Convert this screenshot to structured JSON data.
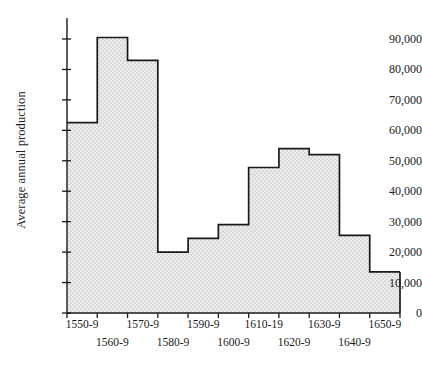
{
  "chart_data": {
    "type": "bar",
    "title": "",
    "subtitle": "",
    "xlabel": "",
    "ylabel": "Average annual production",
    "categories": [
      "1550-9",
      "1560-9",
      "1570-9",
      "1580-9",
      "1590-9",
      "1600-9",
      "1610-19",
      "1620-9",
      "1630-9",
      "1640-9",
      "1650-9"
    ],
    "values": [
      62500,
      90500,
      83000,
      20000,
      24500,
      29000,
      47800,
      54000,
      52000,
      25500,
      13500
    ],
    "ylim": [
      0,
      90000
    ],
    "ytick_values": [
      0,
      10000,
      20000,
      30000,
      40000,
      50000,
      60000,
      70000,
      80000,
      90000
    ],
    "ytick_labels": [
      "0",
      "10,000",
      "20,000",
      "30,000",
      "40,000",
      "50,000",
      "60,000",
      "70,000",
      "80,000",
      "90,000"
    ],
    "grid": false,
    "legend": false,
    "legend_position": "none",
    "bar_fill_color": "#e4e4e4",
    "bar_edge_color": "#1a1a1a",
    "axis_color": "#1a1a1a",
    "background_color": "#ffffff",
    "style": "step-histogram, contiguous bars, stippled grey fill",
    "xtick_label_rows": [
      {
        "row": 0,
        "labels": [
          "1550-9",
          "1570-9",
          "1590-9",
          "1610-19",
          "1630-9",
          "1650-9"
        ],
        "indices": [
          0,
          2,
          4,
          6,
          8,
          10
        ]
      },
      {
        "row": 1,
        "labels": [
          "1560-9",
          "1580-9",
          "1600-9",
          "1620-9",
          "1640-9"
        ],
        "indices": [
          1,
          3,
          5,
          7,
          9
        ]
      }
    ]
  }
}
